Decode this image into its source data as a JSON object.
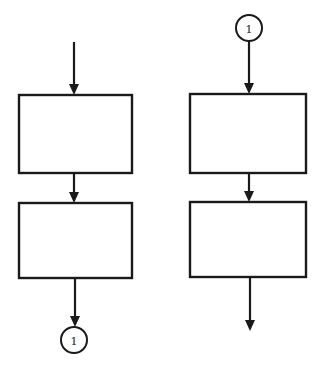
{
  "diagram": {
    "type": "flowchart-off-page-connector",
    "stroke_color": "#1a1a1a",
    "background": "#ffffff",
    "left_column": {
      "entry_arrow": {
        "x": 74,
        "y1": 42,
        "y2": 95
      },
      "boxes": [
        {
          "x": 19,
          "y": 95,
          "w": 113,
          "h": 78,
          "label": ""
        },
        {
          "x": 19,
          "y": 203,
          "w": 113,
          "h": 75,
          "label": ""
        }
      ],
      "arrows": [
        {
          "x": 74,
          "y1": 173,
          "y2": 203
        },
        {
          "x": 75,
          "y1": 278,
          "y2": 327
        }
      ],
      "connector": {
        "cx": 74,
        "cy": 340,
        "r": 13,
        "label": "1"
      }
    },
    "right_column": {
      "connector": {
        "cx": 249,
        "cy": 28,
        "r": 13,
        "label": "1"
      },
      "arrows": [
        {
          "x": 249,
          "y1": 41,
          "y2": 94
        },
        {
          "x": 249,
          "y1": 173,
          "y2": 202
        },
        {
          "x": 250,
          "y1": 277,
          "y2": 331
        }
      ],
      "boxes": [
        {
          "x": 190,
          "y": 94,
          "w": 116,
          "h": 79,
          "label": ""
        },
        {
          "x": 190,
          "y": 202,
          "w": 116,
          "h": 75,
          "label": ""
        }
      ]
    }
  }
}
